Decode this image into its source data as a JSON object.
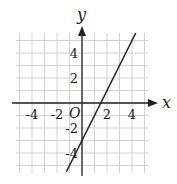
{
  "chart_data": {
    "type": "line",
    "title": "",
    "xlabel": "x",
    "ylabel": "y",
    "origin_label": "O",
    "xlim": [
      -5.3,
      5.3
    ],
    "ylim": [
      -5.6,
      5.6
    ],
    "grid": true,
    "grid_step": 1,
    "x_ticks": [
      -4,
      -2,
      2,
      4
    ],
    "y_ticks": [
      4,
      2,
      -2,
      -4
    ],
    "x_tick_labels": [
      "-4",
      "-2",
      "2",
      "4"
    ],
    "y_tick_labels": [
      "4",
      "2",
      "-2",
      "-4"
    ],
    "series": [
      {
        "name": "y = 2x - 3",
        "slope": 2,
        "intercept": -3,
        "x": [
          -1.25,
          4.3
        ],
        "y": [
          -5.5,
          5.6
        ]
      }
    ],
    "colors": {
      "axis": "#222222",
      "grid": "#c8c8c8",
      "line": "#222222"
    }
  }
}
